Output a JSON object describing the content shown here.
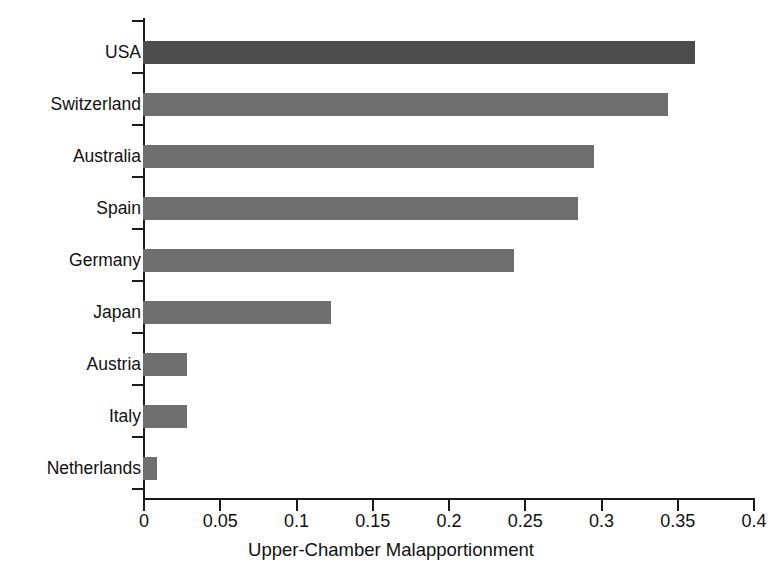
{
  "chart_data": {
    "type": "bar",
    "orientation": "horizontal",
    "title": "",
    "xlabel": "Upper-Chamber Malapportionment",
    "ylabel": "",
    "categories": [
      "USA",
      "Switzerland",
      "Australia",
      "Spain",
      "Germany",
      "Japan",
      "Austria",
      "Italy",
      "Netherlands"
    ],
    "values": [
      0.362,
      0.344,
      0.296,
      0.285,
      0.243,
      0.123,
      0.029,
      0.029,
      0.009
    ],
    "xlim": [
      0,
      0.4
    ],
    "xticks": [
      0,
      0.05,
      0.1,
      0.15,
      0.2,
      0.25,
      0.3,
      0.35,
      0.4
    ],
    "xtick_labels": [
      "0",
      "0.05",
      "0.1",
      "0.15",
      "0.2",
      "0.25",
      "0.3",
      "0.35",
      "0.4"
    ],
    "grid": false,
    "legend": null,
    "bar_color": "#6e6e6e",
    "highlight_color": "#4d4d4d",
    "highlight_category": "USA",
    "axis_color": "#1a1a1a",
    "background": "#ffffff"
  }
}
